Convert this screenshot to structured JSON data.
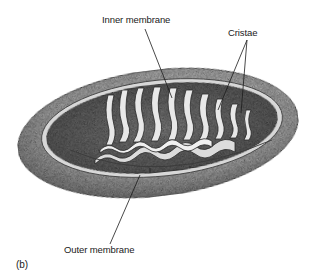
{
  "figure": {
    "panel_label": "(b)",
    "labels": {
      "inner_membrane": "Inner membrane",
      "cristae": "Cristae",
      "outer_membrane": "Outer membrane"
    },
    "colors": {
      "background": "#ffffff",
      "outer_shell": "#bdbdbd",
      "outer_shell_dark": "#8a8a8a",
      "matrix": "#9e9e9e",
      "cristae_fill": "#e6e6e6",
      "ink": "#1a1a1a"
    }
  }
}
